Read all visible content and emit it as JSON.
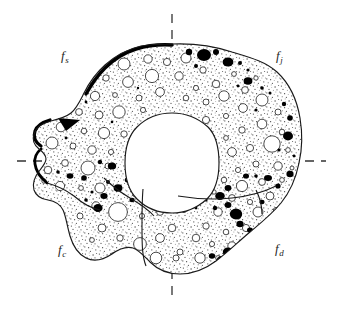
{
  "figure": {
    "kind": "annulus-cross-section-schematic",
    "background_color": "#ffffff",
    "outline_color": "#1a1a1a",
    "stipple_color": "#555555",
    "void_fill": "#ffffff",
    "blob_color": "#000000",
    "axis_color": "#333333",
    "label_color": "#262626"
  },
  "labels": {
    "top_left": {
      "symbol": "f",
      "subscript": "s",
      "text": "fs"
    },
    "top_right": {
      "symbol": "f",
      "subscript": "j",
      "text": "fj"
    },
    "bottom_left": {
      "symbol": "f",
      "subscript": "c",
      "text": "fc"
    },
    "bottom_right": {
      "symbol": "f",
      "subscript": "d",
      "text": "fd"
    }
  },
  "axes": {
    "horizontal": {
      "y": 161,
      "x_start": 17,
      "x_end": 326,
      "style": "dashed"
    },
    "vertical": {
      "x": 172,
      "y_start": 14,
      "y_end": 301,
      "style": "dashed"
    }
  },
  "bore": {
    "center_x": 172,
    "center_y": 163,
    "radius_x": 47,
    "radius_y": 50
  },
  "extents": {
    "left": 41,
    "right": 301,
    "top": 44,
    "bottom": 274
  }
}
